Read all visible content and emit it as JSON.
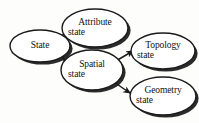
{
  "diagram": {
    "type": "directed-graph",
    "background_color": "#fdfdfb",
    "stroke_color": "#1a1a1a",
    "fill_color": "#ffffff",
    "shadow_color": "#2b2b2b",
    "nodes": [
      {
        "id": "state",
        "label_line1": "State",
        "label_line2": "",
        "cx": 40,
        "cy": 46,
        "rx": 30,
        "ry": 16
      },
      {
        "id": "attribute-state",
        "label_line1": "Attribute",
        "label_line2": "state",
        "cx": 95,
        "cy": 28,
        "rx": 33,
        "ry": 19
      },
      {
        "id": "spatial-state",
        "label_line1": "Spatial",
        "label_line2": "state",
        "cx": 92,
        "cy": 70,
        "rx": 31,
        "ry": 20
      },
      {
        "id": "topology-state",
        "label_line1": "Topology",
        "label_line2": "state",
        "cx": 163,
        "cy": 51,
        "rx": 32,
        "ry": 18
      },
      {
        "id": "geometry-state",
        "label_line1": "Geometry",
        "label_line2": "state",
        "cx": 163,
        "cy": 96,
        "rx": 33,
        "ry": 19
      }
    ],
    "edges": [
      {
        "id": "state-to-attribute",
        "from": "state",
        "to": "attribute-state",
        "arrowhead": "filled"
      },
      {
        "id": "state-to-spatial",
        "from": "state",
        "to": "spatial-state",
        "arrowhead": "filled"
      },
      {
        "id": "spatial-to-topology",
        "from": "spatial-state",
        "to": "topology-state",
        "arrowhead": "filled"
      },
      {
        "id": "spatial-to-geometry",
        "from": "spatial-state",
        "to": "geometry-state",
        "arrowhead": "filled"
      }
    ]
  }
}
